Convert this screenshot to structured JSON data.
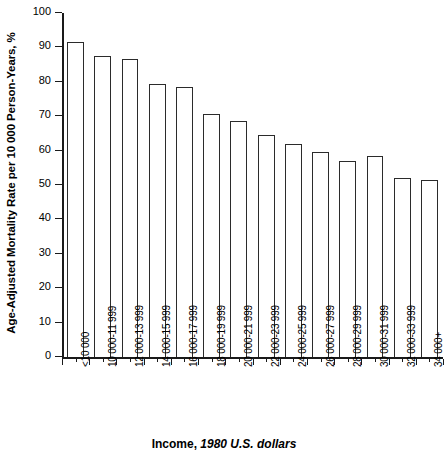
{
  "chart_data": {
    "type": "bar",
    "title": "",
    "xlabel": "Income, 1980 U.S. dollars",
    "xlabel_plain": "Income,",
    "xlabel_italic": "1980 U.S. dollars",
    "ylabel": "Age-Adjusted Mortality Rate per 10 000 Person-Years, %",
    "categories": [
      "<10 000",
      "10 000-11 999",
      "12 000-13 999",
      "14 000-15 999",
      "16 000-17 999",
      "18 000-19 999",
      "20 000-21 999",
      "22 000-23 999",
      "24 000-25 999",
      "26 000-27 999",
      "28 000-29 999",
      "30 000-31 999",
      "32 000-33 999",
      "34 000+"
    ],
    "values": [
      91.5,
      87.5,
      86.5,
      79.5,
      78.5,
      70.5,
      68.5,
      64.5,
      62.0,
      59.5,
      57.0,
      58.5,
      52.0,
      51.5
    ],
    "ylim": [
      0,
      100
    ],
    "ytick_values": [
      0,
      10,
      20,
      30,
      40,
      50,
      60,
      70,
      80,
      90,
      100
    ],
    "ytick_labels": [
      "0",
      "10",
      "20",
      "30",
      "40",
      "50",
      "60",
      "70",
      "80",
      "90",
      "100"
    ],
    "grid": false,
    "legend": false,
    "bar_face_color": "#ffffff",
    "bar_edge_color": "#2b2b2b",
    "axis_color": "#1a1a1a"
  }
}
